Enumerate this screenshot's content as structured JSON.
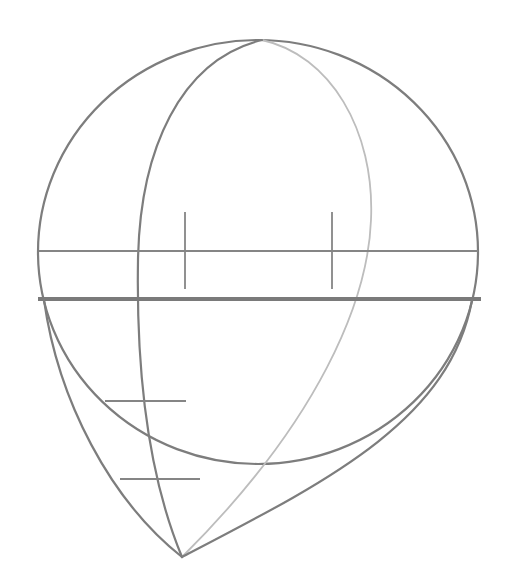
{
  "figure": {
    "width": 514,
    "height": 582,
    "background": "#ffffff",
    "colors": {
      "line_dark": "#7d7d7d",
      "line_light": "#bdbdbd",
      "line_thick": "#7a7a7a"
    },
    "elements": {
      "cranium_circle": {
        "cx": 258,
        "cy": 252,
        "rx": 220,
        "ry": 212
      },
      "brow_line": {
        "x1": 39,
        "y1": 251,
        "x2": 478,
        "y2": 251
      },
      "nose_base_line": {
        "x1": 38,
        "y1": 299,
        "x2": 481,
        "y2": 299
      },
      "eye_ticks": [
        {
          "x": 185,
          "y1": 212,
          "y2": 289
        },
        {
          "x": 332,
          "y1": 212,
          "y2": 289
        }
      ],
      "feature_ticks": [
        {
          "x1": 105,
          "x2": 186,
          "y": 401
        },
        {
          "x1": 120,
          "x2": 200,
          "y": 479
        }
      ],
      "chin_point": {
        "x": 182,
        "y": 557
      }
    }
  }
}
